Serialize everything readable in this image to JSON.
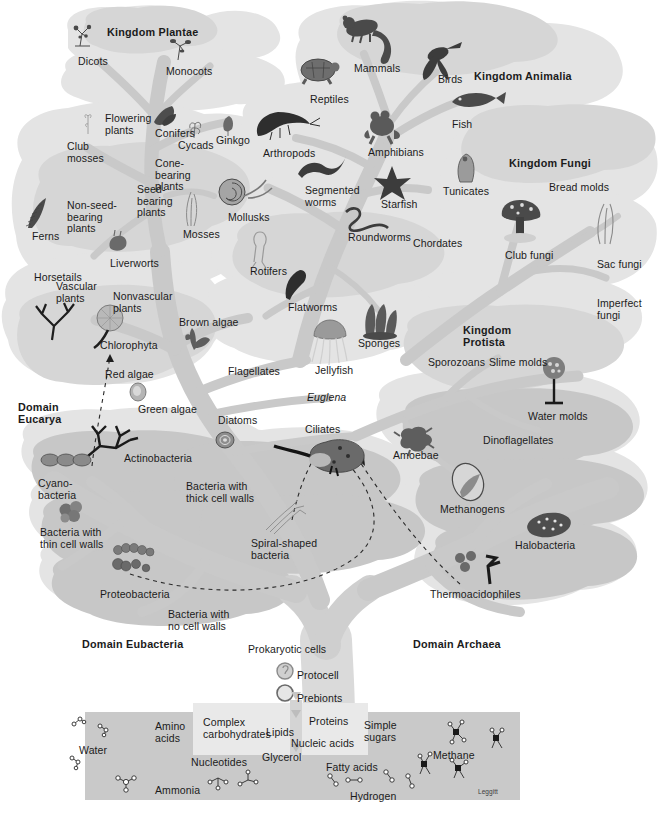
{
  "figure": {
    "credit": "Leggitt",
    "palette": {
      "canopy_light": "#e2e2e2",
      "canopy_mid": "#d4d4d4",
      "canopy_dark": "#c6c6c6",
      "branch": "#c9c9c9",
      "branch_dark": "#bcbcbc",
      "trunk": "#d9d9d9",
      "soup_box": "#c8c8c8",
      "soup_box_light": "#e8e8e8",
      "text": "#1b1b1b",
      "background": "#ffffff"
    }
  },
  "domains": [
    {
      "id": "eucarya",
      "label": "Domain\nEucarya",
      "x": 18,
      "y": 402
    },
    {
      "id": "eubacteria",
      "label": "Domain Eubacteria",
      "x": 82,
      "y": 639
    },
    {
      "id": "archaea",
      "label": "Domain Archaea",
      "x": 413,
      "y": 639
    }
  ],
  "kingdoms": [
    {
      "id": "plantae",
      "label": "Kingdom Plantae",
      "x": 107,
      "y": 27
    },
    {
      "id": "animalia",
      "label": "Kingdom Animalia",
      "x": 474,
      "y": 71
    },
    {
      "id": "fungi",
      "label": "Kingdom Fungi",
      "x": 509,
      "y": 158
    },
    {
      "id": "protista",
      "label": "Kingdom\nProtista",
      "x": 463,
      "y": 325
    }
  ],
  "taxa": [
    {
      "id": "dicots",
      "label": "Dicots",
      "x": 78,
      "y": 56,
      "align": "left"
    },
    {
      "id": "monocots",
      "label": "Monocots",
      "x": 166,
      "y": 66,
      "align": "left"
    },
    {
      "id": "flowering-plants",
      "label": "Flowering\nplants",
      "x": 105,
      "y": 113,
      "align": "left"
    },
    {
      "id": "conifers",
      "label": "Conifers",
      "x": 155,
      "y": 128,
      "align": "left"
    },
    {
      "id": "cycads",
      "label": "Cycads",
      "x": 178,
      "y": 140,
      "align": "left"
    },
    {
      "id": "ginkgo",
      "label": "Ginkgo",
      "x": 216,
      "y": 135,
      "align": "left"
    },
    {
      "id": "club-mosses",
      "label": "Club\nmosses",
      "x": 67,
      "y": 141,
      "align": "left"
    },
    {
      "id": "cone-bearing",
      "label": "Cone-\nbearing\nplants",
      "x": 155,
      "y": 158,
      "align": "left"
    },
    {
      "id": "seed-bearing",
      "label": "Seed-\nbearing\nplants",
      "x": 137,
      "y": 184,
      "align": "left"
    },
    {
      "id": "non-seed-bearing",
      "label": "Non-seed-\nbearing\nplants",
      "x": 67,
      "y": 200,
      "align": "left"
    },
    {
      "id": "mosses",
      "label": "Mosses",
      "x": 183,
      "y": 229,
      "align": "left"
    },
    {
      "id": "ferns",
      "label": "Ferns",
      "x": 32,
      "y": 231,
      "align": "left"
    },
    {
      "id": "liverworts",
      "label": "Liverworts",
      "x": 110,
      "y": 258,
      "align": "left"
    },
    {
      "id": "horsetails",
      "label": "Horsetails",
      "x": 34,
      "y": 272,
      "align": "left"
    },
    {
      "id": "vascular-plants",
      "label": "Vascular\nplants",
      "x": 56,
      "y": 281,
      "align": "left"
    },
    {
      "id": "nonvascular-plants",
      "label": "Nonvascular\nplants",
      "x": 113,
      "y": 291,
      "align": "left"
    },
    {
      "id": "chlorophyta",
      "label": "Chlorophyta",
      "x": 100,
      "y": 340,
      "align": "left"
    },
    {
      "id": "red-algae",
      "label": "Red algae",
      "x": 105,
      "y": 369,
      "align": "left"
    },
    {
      "id": "green-algae",
      "label": "Green algae",
      "x": 138,
      "y": 404,
      "align": "left"
    },
    {
      "id": "brown-algae",
      "label": "Brown algae",
      "x": 179,
      "y": 317,
      "align": "left"
    },
    {
      "id": "flagellates",
      "label": "Flagellates",
      "x": 228,
      "y": 366,
      "align": "left"
    },
    {
      "id": "diatoms",
      "label": "Diatoms",
      "x": 218,
      "y": 415,
      "align": "left"
    },
    {
      "id": "euglena",
      "label": "Euglena",
      "x": 307,
      "y": 392,
      "align": "left",
      "italic": true
    },
    {
      "id": "ciliates",
      "label": "Ciliates",
      "x": 305,
      "y": 424,
      "align": "left"
    },
    {
      "id": "actinobacteria",
      "label": "Actinobacteria",
      "x": 124,
      "y": 453,
      "align": "left"
    },
    {
      "id": "cyanobacteria",
      "label": "Cyano-\nbacteria",
      "x": 38,
      "y": 478,
      "align": "left"
    },
    {
      "id": "bacteria-thin",
      "label": "Bacteria with\nthin cell walls",
      "x": 40,
      "y": 527,
      "align": "left"
    },
    {
      "id": "bacteria-thick",
      "label": "Bacteria with\nthick cell walls",
      "x": 186,
      "y": 481,
      "align": "left"
    },
    {
      "id": "proteobacteria",
      "label": "Proteobacteria",
      "x": 100,
      "y": 589,
      "align": "left"
    },
    {
      "id": "spiral-bacteria",
      "label": "Spiral-shaped\nbacteria",
      "x": 251,
      "y": 538,
      "align": "left"
    },
    {
      "id": "bacteria-nocell",
      "label": "Bacteria with\nno cell walls",
      "x": 168,
      "y": 609,
      "align": "left"
    },
    {
      "id": "rotifers",
      "label": "Rotifers",
      "x": 250,
      "y": 266,
      "align": "left"
    },
    {
      "id": "flatworms",
      "label": "Flatworms",
      "x": 288,
      "y": 302,
      "align": "left"
    },
    {
      "id": "jellyfish",
      "label": "Jellyfish",
      "x": 315,
      "y": 365,
      "align": "left"
    },
    {
      "id": "sponges",
      "label": "Sponges",
      "x": 358,
      "y": 338,
      "align": "left"
    },
    {
      "id": "mollusks",
      "label": "Mollusks",
      "x": 228,
      "y": 212,
      "align": "left"
    },
    {
      "id": "arthropods",
      "label": "Arthropods",
      "x": 263,
      "y": 148,
      "align": "left"
    },
    {
      "id": "segmented-worms",
      "label": "Segmented\nworms",
      "x": 305,
      "y": 185,
      "align": "left"
    },
    {
      "id": "starfish",
      "label": "Starfish",
      "x": 381,
      "y": 199,
      "align": "left"
    },
    {
      "id": "roundworms",
      "label": "Roundworms",
      "x": 348,
      "y": 232,
      "align": "left"
    },
    {
      "id": "chordates",
      "label": "Chordates",
      "x": 413,
      "y": 238,
      "align": "left"
    },
    {
      "id": "mammals",
      "label": "Mammals",
      "x": 354,
      "y": 63,
      "align": "left"
    },
    {
      "id": "reptiles",
      "label": "Reptiles",
      "x": 310,
      "y": 94,
      "align": "left"
    },
    {
      "id": "birds",
      "label": "Birds",
      "x": 438,
      "y": 74,
      "align": "left"
    },
    {
      "id": "amphibians",
      "label": "Amphibians",
      "x": 368,
      "y": 147,
      "align": "left"
    },
    {
      "id": "fish",
      "label": "Fish",
      "x": 452,
      "y": 119,
      "align": "left"
    },
    {
      "id": "tunicates",
      "label": "Tunicates",
      "x": 443,
      "y": 186,
      "align": "left"
    },
    {
      "id": "bread-molds",
      "label": "Bread molds",
      "x": 549,
      "y": 182,
      "align": "left"
    },
    {
      "id": "club-fungi",
      "label": "Club fungi",
      "x": 505,
      "y": 250,
      "align": "left"
    },
    {
      "id": "sac-fungi",
      "label": "Sac fungi",
      "x": 597,
      "y": 259,
      "align": "left"
    },
    {
      "id": "imperfect-fungi",
      "label": "Imperfect\nfungi",
      "x": 597,
      "y": 298,
      "align": "left"
    },
    {
      "id": "sporozoans",
      "label": "Sporozoans",
      "x": 428,
      "y": 357,
      "align": "left"
    },
    {
      "id": "slime-molds",
      "label": "Slime molds",
      "x": 489,
      "y": 357,
      "align": "left"
    },
    {
      "id": "water-molds",
      "label": "Water molds",
      "x": 528,
      "y": 411,
      "align": "left"
    },
    {
      "id": "dinoflagellates",
      "label": "Dinoflagellates",
      "x": 483,
      "y": 435,
      "align": "left"
    },
    {
      "id": "amoebae",
      "label": "Amoebae",
      "x": 393,
      "y": 450,
      "align": "left"
    },
    {
      "id": "methanogens",
      "label": "Methanogens",
      "x": 440,
      "y": 504,
      "align": "left"
    },
    {
      "id": "halobacteria",
      "label": "Halobacteria",
      "x": 515,
      "y": 540,
      "align": "left"
    },
    {
      "id": "thermoacidophiles",
      "label": "Thermoacidophiles",
      "x": 430,
      "y": 589,
      "align": "left"
    }
  ],
  "trunk_labels": [
    {
      "id": "prokaryotic-cells",
      "label": "Prokaryotic cells",
      "x": 248,
      "y": 644
    },
    {
      "id": "protocell",
      "label": "Protocell",
      "x": 297,
      "y": 670
    },
    {
      "id": "prebionts",
      "label": "Prebionts",
      "x": 297,
      "y": 693
    }
  ],
  "primordial_soup": {
    "box": {
      "x": 85,
      "y": 712,
      "w": 435,
      "h": 88
    },
    "inner_box": {
      "x": 193,
      "y": 705,
      "w": 175,
      "h": 50
    },
    "molecules": [
      {
        "id": "water",
        "label": "Water",
        "x": 79,
        "y": 745
      },
      {
        "id": "amino-acids",
        "label": "Amino\nacids",
        "x": 155,
        "y": 721
      },
      {
        "id": "complex-carbohydrates",
        "label": "Complex\ncarbohydrates",
        "x": 203,
        "y": 717
      },
      {
        "id": "lipids",
        "label": "Lipids",
        "x": 266,
        "y": 727
      },
      {
        "id": "proteins",
        "label": "Proteins",
        "x": 309,
        "y": 716
      },
      {
        "id": "nucleic-acids",
        "label": "Nucleic acids",
        "x": 291,
        "y": 738
      },
      {
        "id": "simple-sugars",
        "label": "Simple\nsugars",
        "x": 364,
        "y": 720
      },
      {
        "id": "nucleotides",
        "label": "Nucleotides",
        "x": 191,
        "y": 757
      },
      {
        "id": "glycerol",
        "label": "Glycerol",
        "x": 262,
        "y": 752
      },
      {
        "id": "fatty-acids",
        "label": "Fatty acids",
        "x": 326,
        "y": 762
      },
      {
        "id": "methane",
        "label": "Methane",
        "x": 433,
        "y": 750
      },
      {
        "id": "ammonia",
        "label": "Ammonia",
        "x": 155,
        "y": 785
      },
      {
        "id": "hydrogen",
        "label": "Hydrogen",
        "x": 350,
        "y": 791
      }
    ]
  },
  "icons": {
    "dicots": "dicot-plant-icon",
    "monocots": "monocot-plant-icon",
    "conifers": "conifer-branch-icon",
    "cycads": "cycad-icon",
    "ginkgo": "ginkgo-leaf-icon",
    "club_mosses": "club-moss-icon",
    "ferns": "fern-frond-icon",
    "mosses": "moss-icon",
    "liverworts": "liverwort-icon",
    "chlorophyta": "chlorophyta-icon",
    "green_algae": "green-algae-cell-icon",
    "brown_algae": "brown-algae-icon",
    "diatoms": "diatom-icon",
    "actinobacteria": "actinobacteria-icon",
    "cyanobacteria": "cyanobacteria-chain-icon",
    "bacteria_thin": "coccus-cluster-icon",
    "proteobacteria": "proteobacteria-cluster-icon",
    "spiral_bacteria": "spirochete-icon",
    "ciliates": "paramecium-icon",
    "amoebae": "amoeba-icon",
    "methanogens": "methanogen-cell-icon",
    "halobacteria": "halobacterium-icon",
    "thermoacidophiles": "thermoacidophile-icon",
    "slime_molds": "water-mold-stalk-icon",
    "club_fungi": "mushroom-icon",
    "sac_fungi": "sac-fungi-icon",
    "mammals": "chipmunk-icon",
    "reptiles": "turtle-icon",
    "birds": "hummingbird-icon",
    "fish": "fish-icon",
    "amphibians": "frog-icon",
    "arthropods": "shrimp-icon",
    "mollusks": "snail-icon",
    "segmented_worms": "annelid-worm-icon",
    "starfish": "starfish-icon",
    "roundworms": "nematode-icon",
    "tunicates": "tunicate-icon",
    "rotifers": "rotifer-icon",
    "flatworms": "flatworm-icon",
    "jellyfish": "jellyfish-icon",
    "sponges": "sponge-icon",
    "protocell": "protocell-icon",
    "prebionts": "prebiont-circle-icon"
  }
}
